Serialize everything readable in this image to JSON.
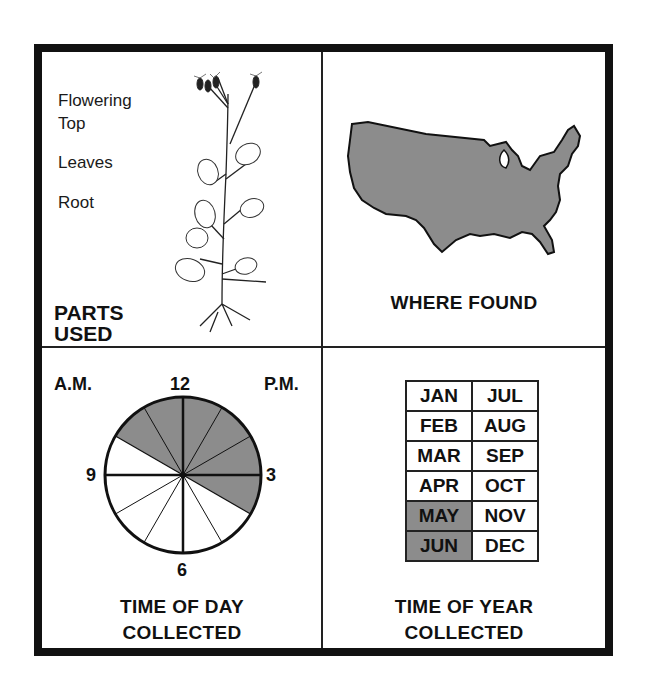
{
  "panels": {
    "parts_used": {
      "title_line1": "PARTS",
      "title_line2": "USED",
      "parts": [
        "Flowering",
        "Top",
        "Leaves",
        "Root"
      ],
      "parts_list": [
        "Flowering Top",
        "Leaves",
        "Root"
      ],
      "illustration": "plant-illustration"
    },
    "where_found": {
      "title": "WHERE FOUND",
      "illustration": "usa-map",
      "fill_color": "#8c8c8c"
    },
    "time_of_day": {
      "title_line1": "TIME OF DAY",
      "title_line2": "COLLECTED",
      "am_label": "A.M.",
      "pm_label": "P.M.",
      "hour_labels": {
        "top": "12",
        "right": "3",
        "bottom": "6",
        "left": "9"
      },
      "shaded_from_hour": 10,
      "shaded_to_hour": 4,
      "shade_color": "#8c8c8c"
    },
    "time_of_year": {
      "title_line1": "TIME OF YEAR",
      "title_line2": "COLLECTED",
      "rows": [
        [
          {
            "label": "JAN",
            "on": false
          },
          {
            "label": "JUL",
            "on": false
          }
        ],
        [
          {
            "label": "FEB",
            "on": false
          },
          {
            "label": "AUG",
            "on": false
          }
        ],
        [
          {
            "label": "MAR",
            "on": false
          },
          {
            "label": "SEP",
            "on": false
          }
        ],
        [
          {
            "label": "APR",
            "on": false
          },
          {
            "label": "OCT",
            "on": false
          }
        ],
        [
          {
            "label": "MAY",
            "on": true
          },
          {
            "label": "NOV",
            "on": false
          }
        ],
        [
          {
            "label": "JUN",
            "on": true
          },
          {
            "label": "DEC",
            "on": false
          }
        ]
      ],
      "shade_color": "#8c8c8c"
    }
  }
}
